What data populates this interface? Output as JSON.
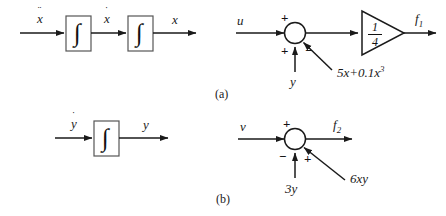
{
  "figure": {
    "background_color": "#ffffff",
    "line_color": "#1a1a1a",
    "captions": [
      {
        "id": "a",
        "text": "(a)"
      },
      {
        "id": "b",
        "text": "(b)"
      }
    ]
  },
  "panel_a_integrators": {
    "name": "double-integrator-chain-x",
    "input_label": "x",
    "input_dots": "¨",
    "mid_label": "x",
    "mid_dots": "˙",
    "output_label": "x",
    "block1_symbol": "∫",
    "block2_symbol": "∫"
  },
  "panel_a_summer": {
    "name": "summing-junction-f1",
    "input_label": "u",
    "input_sign": "+",
    "feedback_down_label": "y",
    "feedback_down_sign": "+",
    "feedback_diag_label": "5x+0.1x",
    "feedback_diag_exponent": "3",
    "feedback_diag_sign": "−",
    "gain_numerator": "1",
    "gain_denominator": "4",
    "output_label": "f",
    "output_subscript": "1"
  },
  "panel_b_integrator": {
    "name": "integrator-chain-y",
    "input_label": "y",
    "input_dots": "˙",
    "output_label": "y",
    "block_symbol": "∫"
  },
  "panel_b_summer": {
    "name": "summing-junction-f2",
    "input_label": "v",
    "input_sign": "+",
    "feedback_down_label": "3y",
    "feedback_down_sign": "−",
    "feedback_diag_label": "6xy",
    "feedback_diag_sign": "+",
    "output_label": "f",
    "output_subscript": "2"
  }
}
